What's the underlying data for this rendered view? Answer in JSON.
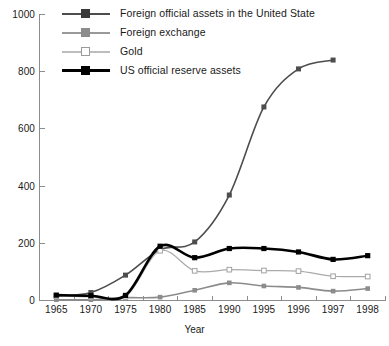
{
  "chart_data": {
    "type": "line",
    "title": "",
    "xlabel": "Year",
    "ylabel": "",
    "categories": [
      "1965",
      "1970",
      "1975",
      "1980",
      "1985",
      "1990",
      "1995",
      "1996",
      "1997",
      "1998"
    ],
    "ylim": [
      0,
      1000
    ],
    "yticks": [
      0,
      200,
      400,
      600,
      800,
      1000
    ],
    "grid": false,
    "legend_position": "top-left-inside",
    "series": [
      {
        "name": "Foreign official assets in the United State",
        "color": "#4d4d4d",
        "marker": "filled-square",
        "values": [
          13,
          26,
          87,
          176,
          203,
          367,
          675,
          808,
          839,
          null
        ]
      },
      {
        "name": "Foreign exchange",
        "color": "#8c8c8c",
        "marker": "filled-square",
        "values": [
          1,
          1,
          8,
          10,
          34,
          60,
          49,
          44,
          31,
          40
        ]
      },
      {
        "name": "Gold",
        "color": "#aaaaaa",
        "marker": "open-square",
        "values": [
          14,
          11,
          11,
          172,
          102,
          106,
          103,
          101,
          83,
          82
        ]
      },
      {
        "name": "US official reserve assets",
        "color": "#000000",
        "marker": "filled-square",
        "values": [
          17,
          15,
          16,
          188,
          148,
          180,
          180,
          168,
          142,
          155
        ]
      }
    ]
  },
  "legend": {
    "items": [
      {
        "label": "Foreign official assets in the United State"
      },
      {
        "label": "Foreign exchange"
      },
      {
        "label": "Gold"
      },
      {
        "label": "US official reserve assets"
      }
    ]
  },
  "axes": {
    "y_labels": [
      "1000",
      "800",
      "600",
      "400",
      "200",
      "0"
    ],
    "x_labels": [
      "1965",
      "1970",
      "1975",
      "1980",
      "1985",
      "1990",
      "1995",
      "1996",
      "1997",
      "1998"
    ],
    "x_title": "Year"
  }
}
